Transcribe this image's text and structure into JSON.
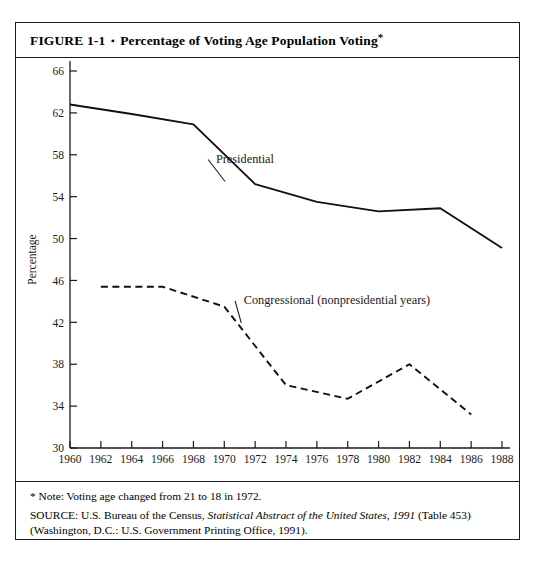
{
  "figure": {
    "label": "FIGURE 1-1",
    "bullet": "▪",
    "title": "Percentage of Voting Age Population Voting",
    "title_marker": "*"
  },
  "notes": {
    "footnote": "* Note: Voting age changed from 21 to 18 in 1972.",
    "source_prefix": "SOURCE: U.S. Bureau of the Census, ",
    "source_italic": "Statistical Abstract of the United States, 1991",
    "source_suffix": " (Table 453)",
    "source_line2": "(Washington, D.C.: U.S. Government Printing Office, 1991)."
  },
  "chart_data": {
    "type": "line",
    "title": "Percentage of Voting Age Population Voting",
    "xlabel": "",
    "ylabel": "Percentage",
    "xlim": [
      1960,
      1988
    ],
    "ylim": [
      30,
      66
    ],
    "ytick_labels": [
      "66",
      "62",
      "58",
      "54",
      "50",
      "46",
      "42",
      "38",
      "34",
      "30"
    ],
    "yticks": [
      66,
      62,
      58,
      54,
      50,
      46,
      42,
      38,
      34,
      30
    ],
    "xtick_labels": [
      "1960",
      "1962",
      "1964",
      "1966",
      "1968",
      "1970",
      "1972",
      "1974",
      "1976",
      "1978",
      "1980",
      "1982",
      "1984",
      "1986",
      "1988"
    ],
    "xticks": [
      1960,
      1962,
      1964,
      1966,
      1968,
      1970,
      1972,
      1974,
      1976,
      1978,
      1980,
      1982,
      1984,
      1986,
      1988
    ],
    "grid": false,
    "legend_position": "inline-annotations",
    "series": [
      {
        "name": "Presidential",
        "style": "solid",
        "color": "#111111",
        "label_text": "Presidential",
        "x": [
          1960,
          1964,
          1968,
          1972,
          1976,
          1980,
          1984,
          1988
        ],
        "values": [
          62.8,
          61.9,
          60.9,
          55.2,
          53.5,
          52.6,
          52.9,
          49.1
        ]
      },
      {
        "name": "Congressional (nonpresidential years)",
        "style": "dashed",
        "color": "#111111",
        "label_text": "Congressional (nonpresidential years)",
        "x": [
          1962,
          1966,
          1970,
          1974,
          1978,
          1982,
          1986
        ],
        "values": [
          45.4,
          45.4,
          43.5,
          36.0,
          34.7,
          38.0,
          33.2
        ]
      }
    ],
    "annotations": [
      {
        "text": "Presidential",
        "at_x": 1968.9,
        "at_y": 57.6
      },
      {
        "text": "Congressional (nonpresidential years)",
        "at_x": 1970.6,
        "at_y": 44.1
      }
    ]
  }
}
